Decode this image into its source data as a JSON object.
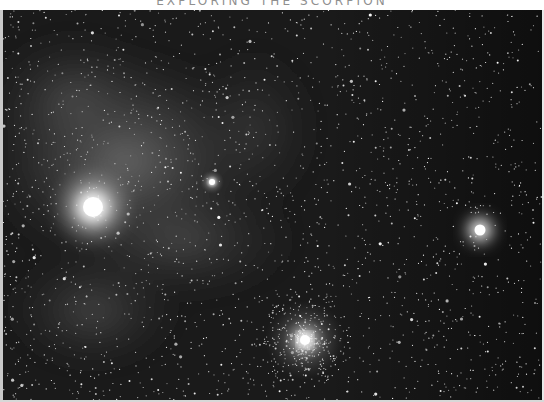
{
  "page": {
    "running_head": "EXPLORING THE SCORPION"
  },
  "photo": {
    "description": "Greyscale astrophotograph of a star field with diffuse nebulosity",
    "colors": {
      "sky": "#141414",
      "nebula": "#6a6a6a",
      "star": "#ffffff"
    },
    "bright_objects": [
      {
        "name": "bright-star-left",
        "x": 93,
        "y": 207,
        "radius": 14
      },
      {
        "name": "bright-star-right",
        "x": 480,
        "y": 230,
        "radius": 8
      },
      {
        "name": "globular-cluster",
        "x": 305,
        "y": 340,
        "radius": 20
      },
      {
        "name": "small-cluster",
        "x": 212,
        "y": 182,
        "radius": 6
      }
    ]
  }
}
